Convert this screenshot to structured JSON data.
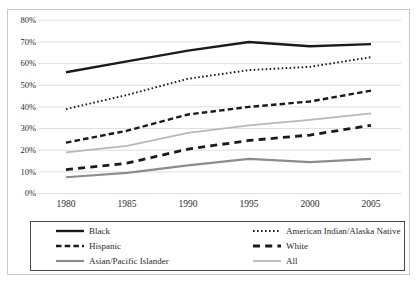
{
  "chart_data": {
    "type": "line",
    "x": [
      1980,
      1985,
      1990,
      1995,
      2000,
      2005
    ],
    "x_tick_labels": [
      "1980",
      "1985",
      "1990",
      "1995",
      "2000",
      "2005"
    ],
    "y_tick_labels": [
      "0%",
      "10%",
      "20%",
      "30%",
      "40%",
      "50%",
      "60%",
      "70%",
      "80%"
    ],
    "ylim": [
      0,
      80
    ],
    "y_tick_step": 10,
    "grid": "horizontal",
    "gridline_color": "#dcdcdc",
    "axis_text_color": "#2b2b2b",
    "legend_position": "bottom-box",
    "series": [
      {
        "name": "Black",
        "values": [
          56,
          61,
          66,
          70,
          68,
          69
        ],
        "color": "#1a1a1a",
        "style": "solid",
        "width": 2.4
      },
      {
        "name": "American Indian/Alaska Native",
        "values": [
          39,
          45.5,
          53,
          57,
          58.5,
          63
        ],
        "color": "#1a1a1a",
        "style": "dotted",
        "width": 1.9
      },
      {
        "name": "Hispanic",
        "values": [
          23.5,
          29,
          36.5,
          40,
          42.5,
          47.5
        ],
        "color": "#1a1a1a",
        "style": "dashed",
        "width": 2.4
      },
      {
        "name": "White",
        "values": [
          11,
          14,
          20.5,
          24.5,
          27,
          31.5
        ],
        "color": "#1a1a1a",
        "style": "long-dash",
        "width": 2.8
      },
      {
        "name": "Asian/Pacific Islander",
        "values": [
          7.5,
          9.5,
          13,
          16,
          14.5,
          16
        ],
        "color": "#8c8c8c",
        "style": "solid",
        "width": 2.2
      },
      {
        "name": "All",
        "values": [
          19,
          22,
          28,
          31.5,
          34,
          37
        ],
        "color": "#b8b8b8",
        "style": "solid",
        "width": 1.8
      }
    ]
  }
}
